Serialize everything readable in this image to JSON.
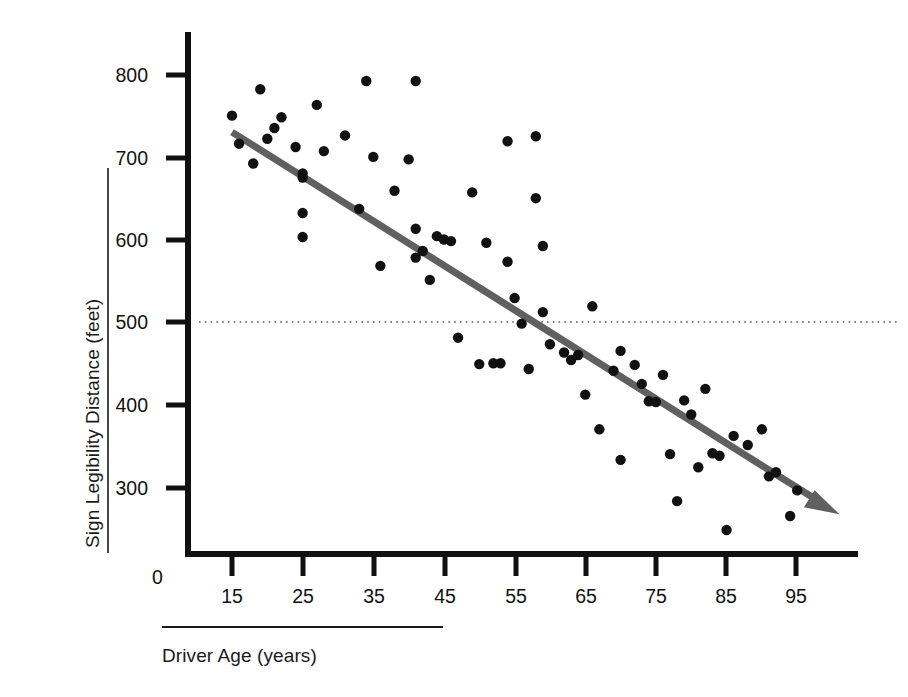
{
  "chart_data": {
    "type": "scatter",
    "title": "",
    "xlabel": "Driver Age (years)",
    "ylabel": "Sign Legibility Distance (feet)",
    "xlim": [
      10,
      103
    ],
    "ylim": [
      215,
      830
    ],
    "xticks": [
      15,
      25,
      35,
      45,
      55,
      65,
      75,
      85,
      95
    ],
    "yticks": [
      300,
      400,
      500,
      600,
      700,
      800
    ],
    "origin_label": "0",
    "grid": false,
    "legend": null,
    "series": [
      {
        "name": "Driver sign legibility",
        "marker": "filled-circle",
        "color": "#111111",
        "points": [
          [
            15,
            750
          ],
          [
            16,
            716
          ],
          [
            18,
            692
          ],
          [
            19,
            782
          ],
          [
            20,
            722
          ],
          [
            21,
            735
          ],
          [
            22,
            748
          ],
          [
            24,
            712
          ],
          [
            25,
            680
          ],
          [
            25,
            675
          ],
          [
            25,
            632
          ],
          [
            25,
            603
          ],
          [
            27,
            763
          ],
          [
            28,
            707
          ],
          [
            31,
            726
          ],
          [
            33,
            637
          ],
          [
            34,
            792
          ],
          [
            35,
            700
          ],
          [
            36,
            568
          ],
          [
            38,
            659
          ],
          [
            40,
            697
          ],
          [
            41,
            792
          ],
          [
            41,
            613
          ],
          [
            41,
            578
          ],
          [
            42,
            586
          ],
          [
            43,
            551
          ],
          [
            44,
            604
          ],
          [
            45,
            600
          ],
          [
            46,
            598
          ],
          [
            47,
            481
          ],
          [
            49,
            657
          ],
          [
            50,
            449
          ],
          [
            51,
            596
          ],
          [
            52,
            450
          ],
          [
            53,
            450
          ],
          [
            54,
            719
          ],
          [
            54,
            573
          ],
          [
            55,
            529
          ],
          [
            56,
            498
          ],
          [
            57,
            443
          ],
          [
            58,
            725
          ],
          [
            58,
            650
          ],
          [
            59,
            592
          ],
          [
            59,
            512
          ],
          [
            60,
            473
          ],
          [
            62,
            463
          ],
          [
            63,
            454
          ],
          [
            64,
            460
          ],
          [
            65,
            412
          ],
          [
            66,
            519
          ],
          [
            67,
            370
          ],
          [
            69,
            441
          ],
          [
            70,
            465
          ],
          [
            70,
            333
          ],
          [
            72,
            448
          ],
          [
            73,
            425
          ],
          [
            74,
            404
          ],
          [
            75,
            403
          ],
          [
            76,
            436
          ],
          [
            77,
            340
          ],
          [
            78,
            283
          ],
          [
            79,
            405
          ],
          [
            80,
            388
          ],
          [
            81,
            324
          ],
          [
            82,
            419
          ],
          [
            83,
            341
          ],
          [
            84,
            338
          ],
          [
            85,
            248
          ],
          [
            86,
            362
          ],
          [
            88,
            351
          ],
          [
            90,
            370
          ],
          [
            91,
            313
          ],
          [
            92,
            318
          ],
          [
            94,
            265
          ],
          [
            95,
            296
          ]
        ]
      }
    ],
    "trend_line": {
      "name": "fitted regression line",
      "color": "#606060",
      "arrow_at_end": true,
      "x_start": 15,
      "y_start": 730,
      "x_end": 101,
      "y_end": 267
    },
    "reference_line": {
      "name": "500 foot reference",
      "value": 500,
      "style": "dotted",
      "color": "#5a5a5a"
    }
  }
}
